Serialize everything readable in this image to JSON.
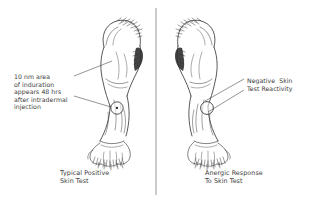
{
  "figure": {
    "background_color": "#ffffff",
    "ink_color": "#3b3b3b",
    "divider": {
      "name": "panel-divider",
      "x": 156,
      "y_top": 8,
      "y_bottom": 195
    }
  },
  "panels": [
    {
      "id": "left",
      "caption": "Typical Positive\nSkin Test",
      "annotation": "10 nm area\nof induration\nappears 48 hrs\nafter intradermal\ninjection",
      "marking": "circle-with-central-dot",
      "limb": "forearm-volar-surface"
    },
    {
      "id": "right",
      "caption": "Anergic Response\nTo Skin Test",
      "annotation": "Negative  Skin\nTest Reactivity",
      "marking": "empty-circle",
      "limb": "forearm-volar-surface"
    }
  ]
}
